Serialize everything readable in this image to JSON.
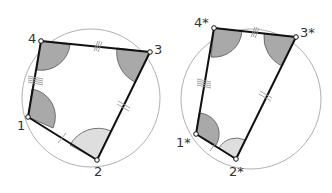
{
  "colors": {
    "circle": "#b0b0b0",
    "edge": "#111111",
    "dark_sector": "#a9a9a9",
    "light_sector": "#dedede",
    "tick": "#9a9a9a",
    "label": "#333333"
  },
  "figures": [
    {
      "name": "quadrilateral",
      "labels": {
        "p1": "1",
        "p2": "2",
        "p3": "3",
        "p4": "4"
      }
    },
    {
      "name": "quadrilateral-star",
      "labels": {
        "p1": "1*",
        "p2": "2*",
        "p3": "3*",
        "p4": "4*"
      }
    }
  ]
}
